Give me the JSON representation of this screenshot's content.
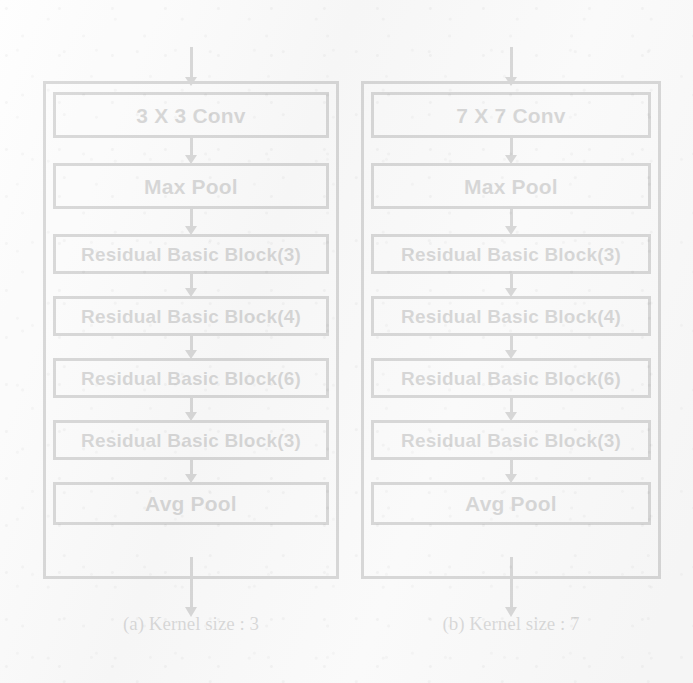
{
  "figure": {
    "stroke_color": "#141414",
    "background_color": "#fbfbfb"
  },
  "columns": [
    {
      "id": "kernel-3",
      "caption": "(a) Kernel size : 3",
      "input_arrow": "arrow-down",
      "output_arrow": "arrow-down",
      "blocks": [
        {
          "label": "3 X 3 Conv",
          "type": "conv"
        },
        {
          "label": "Max Pool",
          "type": "maxpool"
        },
        {
          "label": "Residual Basic Block(3)",
          "type": "residual"
        },
        {
          "label": "Residual Basic Block(4)",
          "type": "residual"
        },
        {
          "label": "Residual Basic Block(6)",
          "type": "residual"
        },
        {
          "label": "Residual Basic Block(3)",
          "type": "residual"
        },
        {
          "label": "Avg Pool",
          "type": "avgpool"
        }
      ]
    },
    {
      "id": "kernel-7",
      "caption": "(b) Kernel size : 7",
      "input_arrow": "arrow-down",
      "output_arrow": "arrow-down",
      "blocks": [
        {
          "label": "7 X 7 Conv",
          "type": "conv"
        },
        {
          "label": "Max Pool",
          "type": "maxpool"
        },
        {
          "label": "Residual Basic Block(3)",
          "type": "residual"
        },
        {
          "label": "Residual Basic Block(4)",
          "type": "residual"
        },
        {
          "label": "Residual Basic Block(6)",
          "type": "residual"
        },
        {
          "label": "Residual Basic Block(3)",
          "type": "residual"
        },
        {
          "label": "Avg Pool",
          "type": "avgpool"
        }
      ]
    }
  ]
}
